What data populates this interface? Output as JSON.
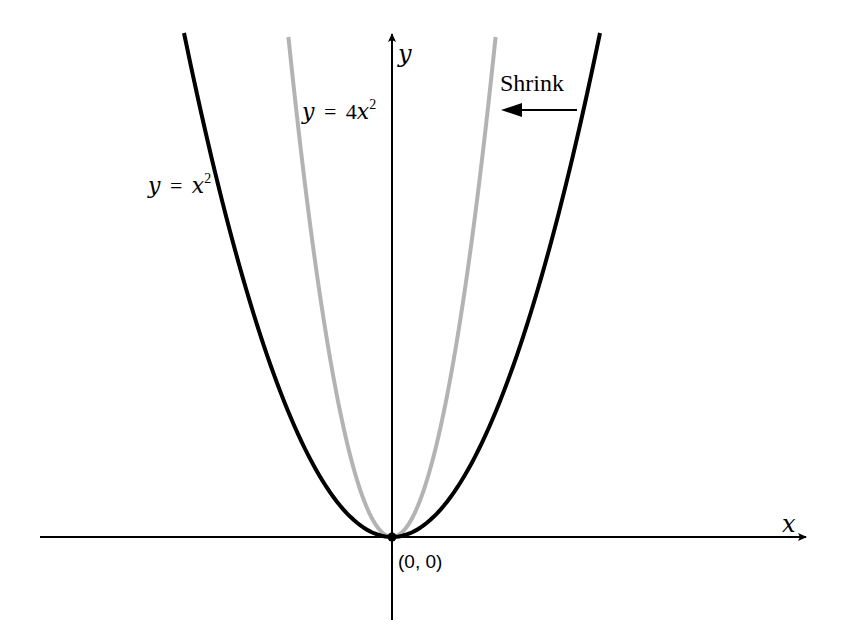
{
  "figure": {
    "axes": {
      "x_label": "x",
      "y_label": "y",
      "origin_label": "(0, 0)"
    },
    "curves": [
      {
        "name": "y = x^2",
        "label_lhs": "y",
        "label_eq": "=",
        "label_coef": "",
        "label_var": "x",
        "label_exp": "2",
        "color": "#000000"
      },
      {
        "name": "y = 4x^2",
        "label_lhs": "y",
        "label_eq": "=",
        "label_coef": "4",
        "label_var": "x",
        "label_exp": "2",
        "color": "#b3b3b3"
      }
    ],
    "annotation": {
      "text": "Shrink",
      "direction": "left"
    }
  },
  "chart_data": {
    "type": "line",
    "title": "",
    "xlabel": "x",
    "ylabel": "y",
    "series": [
      {
        "name": "y = x^2",
        "color": "#000000",
        "formula": "x^2"
      },
      {
        "name": "y = 4x^2",
        "color": "#b3b3b3",
        "formula": "4x^2"
      }
    ],
    "annotations": [
      {
        "text": "Shrink",
        "type": "arrow",
        "direction": "left"
      },
      {
        "text": "(0, 0)",
        "type": "point",
        "x": 0,
        "y": 0
      }
    ],
    "grid": false,
    "legend": "none"
  }
}
